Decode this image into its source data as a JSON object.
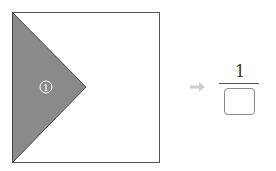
{
  "figure": {
    "shaded_region_label": "①",
    "shape": "square with shaded triangle",
    "shaded_color": "#888888"
  },
  "arrow": {
    "glyph": "➔",
    "color": "#cccccc"
  },
  "fraction": {
    "numerator": "1",
    "denominator": ""
  }
}
